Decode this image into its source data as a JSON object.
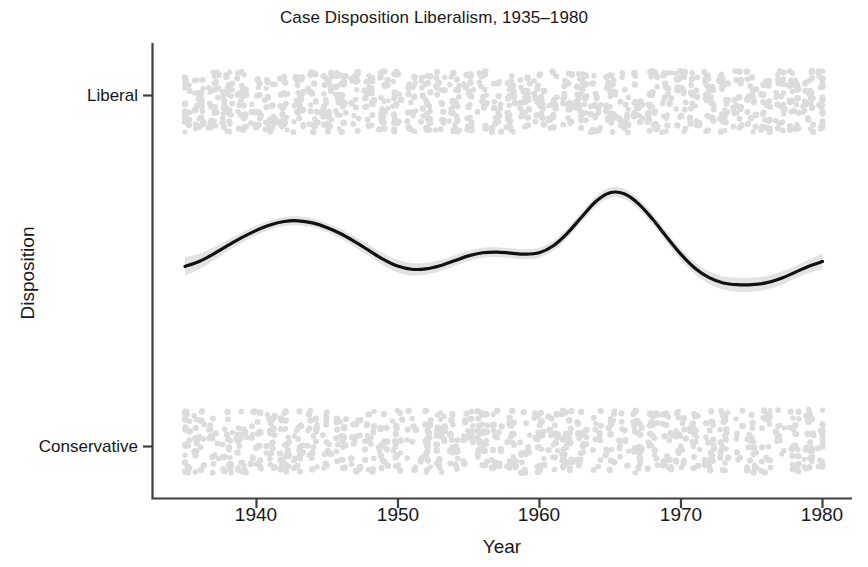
{
  "chart_data": {
    "type": "line",
    "title": "Case Disposition Liberalism, 1935–1980",
    "xlabel": "Year",
    "ylabel": "Disposition",
    "grid": false,
    "legend": null,
    "xlim": [
      1935,
      1980
    ],
    "ylim": [
      0,
      1
    ],
    "xticks": [
      1940,
      1950,
      1960,
      1970,
      1980
    ],
    "xticklabels": [
      "1940",
      "1950",
      "1960",
      "1970",
      "1980"
    ],
    "yticks": [
      0,
      1
    ],
    "yticklabels": [
      "Conservative",
      "Liberal"
    ],
    "series": [
      {
        "name": "smoothed-liberalism",
        "type": "line",
        "color": "#111111",
        "x": [
          1935.0,
          1936.0,
          1937.0,
          1938.0,
          1939.0,
          1940.0,
          1941.0,
          1942.0,
          1943.0,
          1944.0,
          1945.0,
          1946.0,
          1947.0,
          1948.0,
          1949.0,
          1950.0,
          1951.0,
          1952.0,
          1953.0,
          1954.0,
          1955.0,
          1956.0,
          1957.0,
          1958.0,
          1959.0,
          1960.0,
          1961.0,
          1962.0,
          1963.0,
          1964.0,
          1965.0,
          1966.0,
          1967.0,
          1968.0,
          1969.0,
          1970.0,
          1971.0,
          1972.0,
          1973.0,
          1974.0,
          1975.0,
          1976.0,
          1977.0,
          1978.0,
          1979.0,
          1980.0
        ],
        "y": [
          0.513,
          0.527,
          0.548,
          0.572,
          0.595,
          0.615,
          0.631,
          0.641,
          0.643,
          0.637,
          0.624,
          0.606,
          0.583,
          0.558,
          0.533,
          0.514,
          0.505,
          0.506,
          0.515,
          0.529,
          0.543,
          0.552,
          0.554,
          0.551,
          0.548,
          0.552,
          0.572,
          0.608,
          0.654,
          0.698,
          0.723,
          0.72,
          0.692,
          0.648,
          0.597,
          0.548,
          0.508,
          0.481,
          0.466,
          0.461,
          0.461,
          0.466,
          0.478,
          0.495,
          0.513,
          0.527
        ]
      },
      {
        "name": "confidence-band",
        "type": "area",
        "color": "#e3e3e3",
        "x": [
          1935.0,
          1936.0,
          1937.0,
          1938.0,
          1939.0,
          1940.0,
          1941.0,
          1942.0,
          1943.0,
          1944.0,
          1945.0,
          1946.0,
          1947.0,
          1948.0,
          1949.0,
          1950.0,
          1951.0,
          1952.0,
          1953.0,
          1954.0,
          1955.0,
          1956.0,
          1957.0,
          1958.0,
          1959.0,
          1960.0,
          1961.0,
          1962.0,
          1963.0,
          1964.0,
          1965.0,
          1966.0,
          1967.0,
          1968.0,
          1969.0,
          1970.0,
          1971.0,
          1972.0,
          1973.0,
          1974.0,
          1975.0,
          1976.0,
          1977.0,
          1978.0,
          1979.0,
          1980.0
        ],
        "ylo": [
          0.487,
          0.505,
          0.529,
          0.556,
          0.58,
          0.601,
          0.618,
          0.628,
          0.63,
          0.624,
          0.611,
          0.592,
          0.568,
          0.542,
          0.516,
          0.496,
          0.487,
          0.489,
          0.499,
          0.514,
          0.529,
          0.538,
          0.54,
          0.537,
          0.534,
          0.538,
          0.558,
          0.594,
          0.64,
          0.684,
          0.708,
          0.705,
          0.677,
          0.633,
          0.582,
          0.532,
          0.491,
          0.463,
          0.447,
          0.441,
          0.441,
          0.447,
          0.459,
          0.477,
          0.494,
          0.504
        ],
        "yhi": [
          0.539,
          0.549,
          0.567,
          0.588,
          0.61,
          0.629,
          0.644,
          0.654,
          0.656,
          0.65,
          0.637,
          0.62,
          0.598,
          0.574,
          0.55,
          0.532,
          0.523,
          0.523,
          0.531,
          0.544,
          0.557,
          0.566,
          0.568,
          0.565,
          0.562,
          0.566,
          0.586,
          0.622,
          0.668,
          0.712,
          0.738,
          0.735,
          0.707,
          0.663,
          0.612,
          0.564,
          0.525,
          0.499,
          0.485,
          0.481,
          0.481,
          0.485,
          0.497,
          0.513,
          0.532,
          0.55
        ]
      },
      {
        "name": "liberal-outcome-points",
        "type": "scatter",
        "color": "#dcdcdc",
        "jitter_band": [
          0.895,
          1.07
        ],
        "x_range": [
          1935,
          1980
        ],
        "n_points": 1100
      },
      {
        "name": "conservative-outcome-points",
        "type": "scatter",
        "color": "#dcdcdc",
        "jitter_band": [
          -0.075,
          0.105
        ],
        "x_range": [
          1935,
          1980
        ],
        "n_points": 950
      }
    ]
  },
  "figure": {
    "title": "Case Disposition Liberalism, 1935–1980",
    "x_axis_title": "Year",
    "y_axis_title": "Disposition",
    "y_tick_top": "Liberal",
    "y_tick_bottom": "Conservative",
    "x_tick_1": "1940",
    "x_tick_2": "1950",
    "x_tick_3": "1960",
    "x_tick_4": "1970",
    "x_tick_5": "1980",
    "colors": {
      "line": "#111111",
      "band": "#e3e3e3",
      "points": "#dcdcdc",
      "axis": "#444444",
      "text": "#181818",
      "background": "#ffffff"
    }
  }
}
